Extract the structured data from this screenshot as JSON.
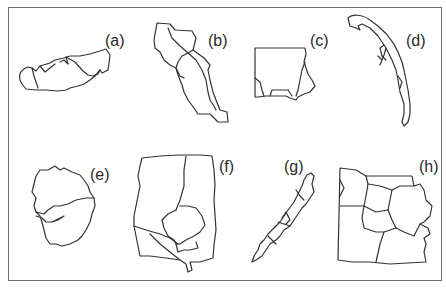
{
  "figure": {
    "frame_color": "#6e6e6e",
    "stroke_color": "#333333",
    "panels": [
      {
        "id": "a",
        "label": "(a)",
        "description": "elongated island-like outline with internal boundaries"
      },
      {
        "id": "b",
        "label": "(b)",
        "description": "diagonal stepped region divided into sub-regions"
      },
      {
        "id": "c",
        "label": "(c)",
        "description": "square region with irregular right and bottom edges"
      },
      {
        "id": "d",
        "label": "(d)",
        "description": "thin curved hook-shaped peninsula"
      },
      {
        "id": "e",
        "label": "(e)",
        "description": "rounded irregular region split into two parts"
      },
      {
        "id": "f",
        "label": "(f)",
        "description": "tall rectangular region with circular enclave and divisions"
      },
      {
        "id": "g",
        "label": "(g)",
        "description": "narrow diagonal archipelago-like strip"
      },
      {
        "id": "h",
        "label": "(h)",
        "description": "region subdivided into county-like polygons"
      }
    ]
  }
}
